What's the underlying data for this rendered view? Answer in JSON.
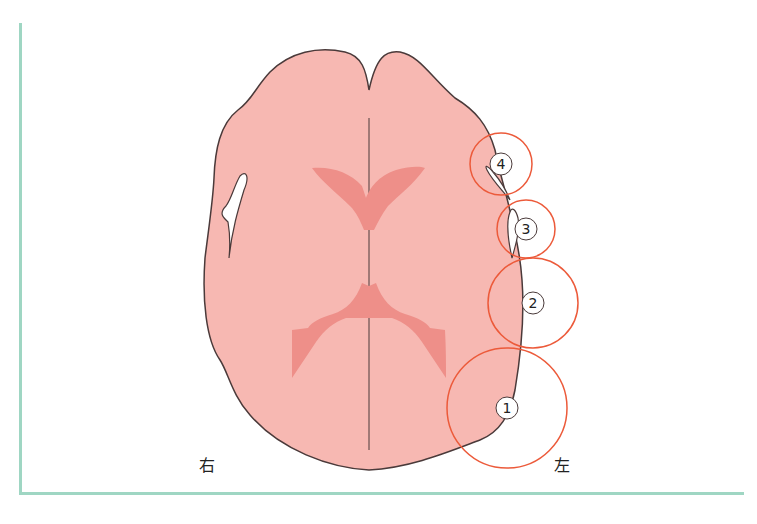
{
  "figure": {
    "type": "axial brain schematic",
    "colors": {
      "frame": "#9fd6c3",
      "brain_fill": "#f7b8b2",
      "ventricle_fill": "#ee8f89",
      "outline": "#4a3a3a",
      "circle_stroke": "#ec5a3a"
    },
    "labels": {
      "right": "右",
      "left": "左"
    },
    "markers": [
      {
        "id": 1,
        "label": "1",
        "cx": 507,
        "cy": 408,
        "r": 60
      },
      {
        "id": 2,
        "label": "2",
        "cx": 533,
        "cy": 303,
        "r": 45
      },
      {
        "id": 3,
        "label": "3",
        "cx": 526,
        "cy": 229,
        "r": 29
      },
      {
        "id": 4,
        "label": "4",
        "cx": 501,
        "cy": 164,
        "r": 31
      }
    ]
  }
}
